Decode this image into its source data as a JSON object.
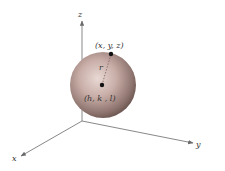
{
  "diagram": {
    "type": "3d-sphere-coordinate-diagram",
    "axes": {
      "x_label": "x",
      "y_label": "y",
      "z_label": "z"
    },
    "sphere": {
      "center_label": "(h, k , l)",
      "surface_point_label": "(x,  y,  z)",
      "radius_label": "r"
    },
    "colors": {
      "axis": "#7a7a7a",
      "sphere_light": "#e6d4d0",
      "sphere_mid": "#b89a94",
      "sphere_dark": "#6e5853",
      "point": "#111111",
      "text": "#333333"
    }
  }
}
